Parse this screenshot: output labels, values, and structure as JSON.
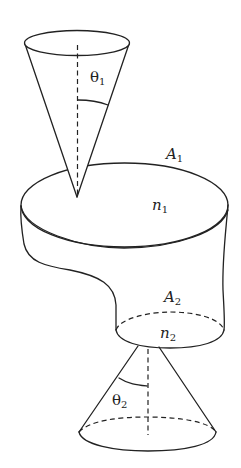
{
  "diagram": {
    "labels": {
      "theta1": {
        "symbol": "θ",
        "sub": "1"
      },
      "A1": {
        "symbol": "A",
        "sub": "1"
      },
      "n1": {
        "symbol": "n",
        "sub": "1"
      },
      "A2": {
        "symbol": "A",
        "sub": "2"
      },
      "n2": {
        "symbol": "n",
        "sub": "2"
      },
      "theta2": {
        "symbol": "θ",
        "sub": "2"
      }
    },
    "colors": {
      "line": "#222222",
      "background": "#ffffff"
    }
  }
}
